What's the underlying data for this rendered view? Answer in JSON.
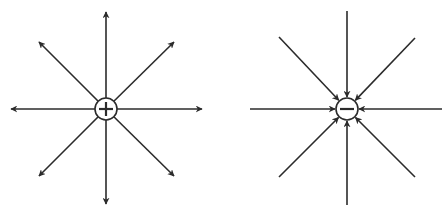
{
  "diagram": {
    "colors": {
      "line": "#2b2b2b",
      "background": "#ffffff"
    },
    "charges": [
      {
        "id": "positive",
        "sign": "+",
        "label": "positive-charge",
        "center": [
          106,
          109
        ],
        "radius": 11,
        "direction": "outward",
        "field_lines": [
          {
            "angle": "up",
            "end": [
              106,
              12
            ]
          },
          {
            "angle": "down",
            "end": [
              106,
              204
            ]
          },
          {
            "angle": "left",
            "end": [
              11,
              109
            ]
          },
          {
            "angle": "right",
            "end": [
              202,
              109
            ]
          },
          {
            "angle": "up-left",
            "end": [
              39,
              42
            ]
          },
          {
            "angle": "up-right",
            "end": [
              174,
              42
            ]
          },
          {
            "angle": "down-left",
            "end": [
              39,
              176
            ]
          },
          {
            "angle": "down-right",
            "end": [
              174,
              176
            ]
          }
        ]
      },
      {
        "id": "negative",
        "sign": "−",
        "label": "negative-charge",
        "center": [
          347,
          109
        ],
        "radius": 11,
        "direction": "inward",
        "field_lines": [
          {
            "angle": "up",
            "end": [
              347,
              11
            ]
          },
          {
            "angle": "down",
            "end": [
              347,
              205
            ]
          },
          {
            "angle": "left",
            "end": [
              250,
              109
            ]
          },
          {
            "angle": "right",
            "end": [
              442,
              109
            ]
          },
          {
            "angle": "up-left",
            "end": [
              279,
              37
            ]
          },
          {
            "angle": "up-right",
            "end": [
              415,
              38
            ]
          },
          {
            "angle": "down-left",
            "end": [
              279,
              177
            ]
          },
          {
            "angle": "down-right",
            "end": [
              415,
              177
            ]
          }
        ]
      }
    ]
  }
}
